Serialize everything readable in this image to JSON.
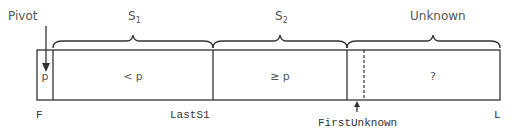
{
  "title_labels": {
    "pivot": "Pivot",
    "s1": "S",
    "s1_sub": "1",
    "s2": "S",
    "s2_sub": "2",
    "unknown": "Unknown"
  },
  "cells": {
    "pivot": "p",
    "s1": "< p",
    "s2": "≥ p",
    "unknown": "?"
  },
  "index_labels": {
    "first": "F",
    "last_s1": "LastS1",
    "first_unknown": "FirstUnknown",
    "last": "L"
  },
  "colors": {
    "line": "#333333",
    "text": "#555555"
  }
}
